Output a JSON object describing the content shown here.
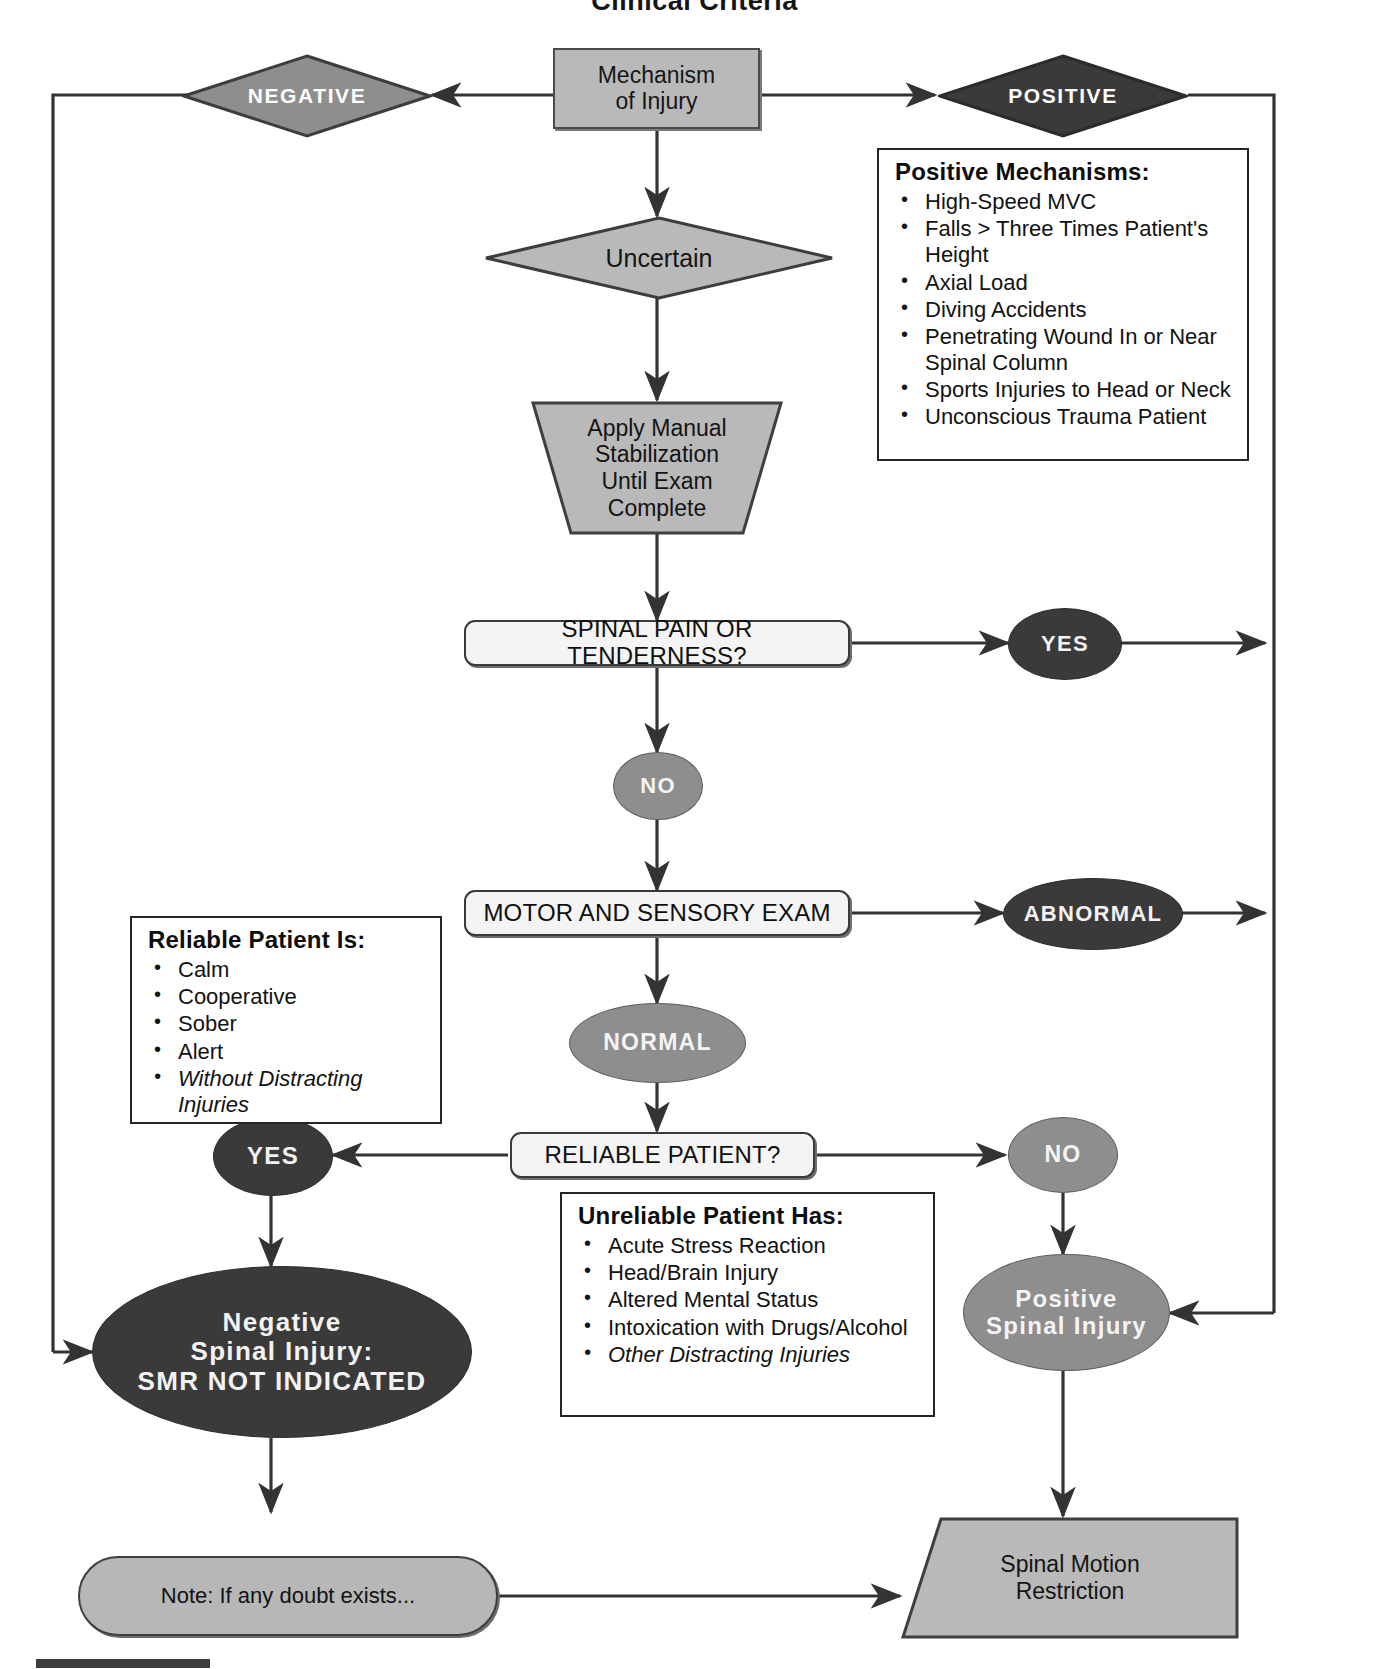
{
  "title": "Clinical Criteria",
  "nodes": {
    "mechanism": {
      "label_line1": "Mechanism",
      "label_line2": "of Injury"
    },
    "negative": {
      "label": "NEGATIVE"
    },
    "positive": {
      "label": "POSITIVE"
    },
    "uncertain": {
      "label": "Uncertain"
    },
    "stabilization": {
      "line1": "Apply Manual",
      "line2": "Stabilization",
      "line3": "Until Exam",
      "line4": "Complete"
    },
    "spinal_pain": {
      "label": "SPINAL PAIN OR TENDERNESS?"
    },
    "spinal_pain_yes": {
      "label": "YES"
    },
    "spinal_pain_no": {
      "label": "NO"
    },
    "motor_sensory": {
      "label": "MOTOR AND SENSORY EXAM"
    },
    "motor_abnormal": {
      "label": "ABNORMAL"
    },
    "motor_normal": {
      "label": "NORMAL"
    },
    "reliable_patient": {
      "label": "RELIABLE PATIENT?"
    },
    "reliable_yes": {
      "label": "YES"
    },
    "reliable_no": {
      "label": "NO"
    },
    "negative_outcome": {
      "line1": "Negative",
      "line2": "Spinal Injury:",
      "line3": "SMR NOT INDICATED"
    },
    "positive_outcome": {
      "line1": "Positive",
      "line2": "Spinal Injury"
    },
    "note": {
      "label": "Note: If any doubt exists..."
    },
    "smr": {
      "line1": "Spinal Motion",
      "line2": "Restriction"
    }
  },
  "callouts": {
    "positive_mechanisms": {
      "title": "Positive Mechanisms:",
      "items": [
        {
          "text": "High-Speed MVC",
          "italic": false
        },
        {
          "text": "Falls > Three Times Patient's Height",
          "italic": false
        },
        {
          "text": "Axial Load",
          "italic": false
        },
        {
          "text": "Diving Accidents",
          "italic": false
        },
        {
          "text": "Penetrating Wound In or Near Spinal Column",
          "italic": false
        },
        {
          "text": "Sports Injuries to Head or Neck",
          "italic": false
        },
        {
          "text": "Unconscious Trauma Patient",
          "italic": false
        }
      ]
    },
    "reliable_patient": {
      "title": "Reliable Patient Is:",
      "items": [
        {
          "text": "Calm",
          "italic": false
        },
        {
          "text": "Cooperative",
          "italic": false
        },
        {
          "text": "Sober",
          "italic": false
        },
        {
          "text": "Alert",
          "italic": false
        },
        {
          "text": "Without Distracting Injuries",
          "italic": true
        }
      ]
    },
    "unreliable_patient": {
      "title": "Unreliable Patient Has:",
      "items": [
        {
          "text": "Acute Stress Reaction",
          "italic": false
        },
        {
          "text": "Head/Brain Injury",
          "italic": false
        },
        {
          "text": "Altered Mental Status",
          "italic": false
        },
        {
          "text": "Intoxication with Drugs/Alcohol",
          "italic": false
        },
        {
          "text": "Other Distracting Injuries",
          "italic": true
        }
      ]
    }
  },
  "colors": {
    "dark_fill": "#3a3a3a",
    "gray_fill": "#8e8e8e",
    "process_fill": "#b9b9b9",
    "line": "#333333",
    "page_bg": "#ffffff"
  }
}
